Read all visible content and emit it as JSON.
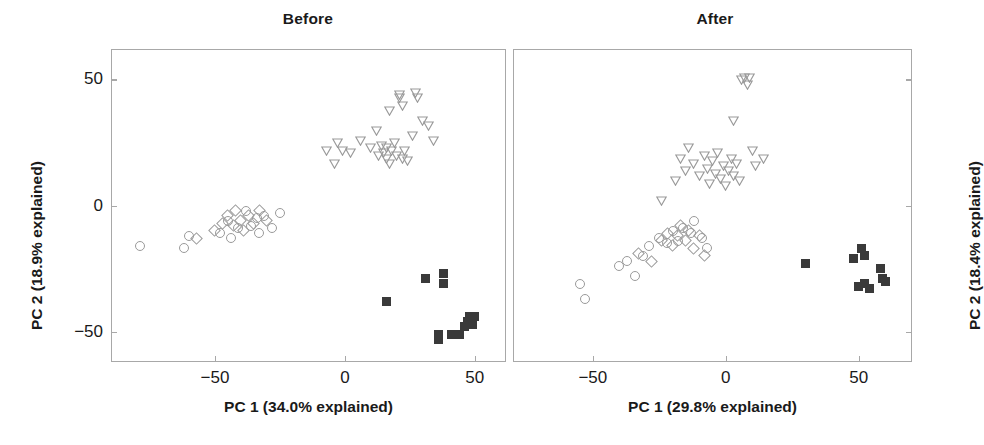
{
  "figure": {
    "width": 983,
    "height": 445,
    "background": "#ffffff",
    "marker_outline_color": "#9a9a9a",
    "filled_marker_color": "#3a3a3a",
    "axis_color": "#a8a8a8"
  },
  "chart_data": [
    {
      "type": "scatter",
      "title": "Before",
      "xlabel": "PC 1 (34.0% explained)",
      "ylabel": "PC 2 (18.9% explained)",
      "xlim": [
        -90,
        62
      ],
      "ylim": [
        -62,
        62
      ],
      "xticks": [
        -50,
        0,
        50
      ],
      "xticklabels": [
        "−50",
        "0",
        "50"
      ],
      "yticks": [
        50,
        0,
        -50
      ],
      "yticklabels": [
        "50",
        "0",
        "−50"
      ],
      "ylabel_side": "left",
      "grid": false,
      "legend": "none",
      "series": [
        {
          "name": "group-circle",
          "marker": "circle",
          "fill": "open",
          "color": "#9a9a9a",
          "points": [
            [
              -79,
              -16
            ],
            [
              -62,
              -17
            ],
            [
              -60,
              -12
            ],
            [
              -48,
              -11
            ],
            [
              -45,
              -6
            ],
            [
              -44,
              -13
            ],
            [
              -41,
              -9
            ],
            [
              -38,
              -2
            ],
            [
              -36,
              -8
            ],
            [
              -34,
              -5
            ],
            [
              -33,
              -11
            ],
            [
              -31,
              -4
            ],
            [
              -28,
              -9
            ],
            [
              -25,
              -3
            ]
          ]
        },
        {
          "name": "group-diamond",
          "marker": "diamond",
          "fill": "open",
          "color": "#9a9a9a",
          "points": [
            [
              -57,
              -13
            ],
            [
              -50,
              -10
            ],
            [
              -47,
              -7
            ],
            [
              -45,
              -4
            ],
            [
              -43,
              -8
            ],
            [
              -42,
              -2
            ],
            [
              -40,
              -6
            ],
            [
              -39,
              -10
            ],
            [
              -37,
              -4
            ],
            [
              -35,
              -7
            ],
            [
              -33,
              -2
            ],
            [
              -30,
              -6
            ]
          ]
        },
        {
          "name": "group-triangle",
          "marker": "triangle-down",
          "fill": "open",
          "color": "#9a9a9a",
          "points": [
            [
              -7,
              22
            ],
            [
              -4,
              17
            ],
            [
              -3,
              25
            ],
            [
              -1,
              22
            ],
            [
              2,
              21
            ],
            [
              6,
              26
            ],
            [
              10,
              23
            ],
            [
              12,
              30
            ],
            [
              13,
              20
            ],
            [
              14,
              24
            ],
            [
              15,
              21
            ],
            [
              16,
              19
            ],
            [
              16,
              23
            ],
            [
              17,
              17
            ],
            [
              18,
              22
            ],
            [
              19,
              25
            ],
            [
              20,
              20
            ],
            [
              21,
              43
            ],
            [
              21,
              44
            ],
            [
              22,
              40
            ],
            [
              22,
              19
            ],
            [
              23,
              22
            ],
            [
              24,
              18
            ],
            [
              26,
              28
            ],
            [
              27,
              45
            ],
            [
              28,
              43
            ],
            [
              30,
              34
            ],
            [
              32,
              32
            ],
            [
              34,
              26
            ],
            [
              17,
              38
            ]
          ]
        },
        {
          "name": "group-square",
          "marker": "square",
          "fill": "filled",
          "color": "#3a3a3a",
          "points": [
            [
              16,
              -38
            ],
            [
              31,
              -29
            ],
            [
              36,
              -53
            ],
            [
              36,
              -51
            ],
            [
              38,
              -27
            ],
            [
              38,
              -31
            ],
            [
              41,
              -51
            ],
            [
              44,
              -51
            ],
            [
              46,
              -48
            ],
            [
              47,
              -46
            ],
            [
              48,
              -44
            ],
            [
              49,
              -47
            ],
            [
              50,
              -44
            ]
          ]
        }
      ]
    },
    {
      "type": "scatter",
      "title": "After",
      "xlabel": "PC 1 (29.8% explained)",
      "ylabel": "PC 2 (18.4% explained)",
      "xlim": [
        -80,
        70
      ],
      "ylim": [
        -62,
        62
      ],
      "xticks": [
        -50,
        0,
        50
      ],
      "xticklabels": [
        "−50",
        "0",
        "50"
      ],
      "yticks": [
        50,
        0,
        -50
      ],
      "yticklabels": [
        "",
        "",
        ""
      ],
      "ylabel_side": "right",
      "grid": false,
      "legend": "none",
      "series": [
        {
          "name": "group-circle",
          "marker": "circle",
          "fill": "open",
          "color": "#9a9a9a",
          "points": [
            [
              -55,
              -31
            ],
            [
              -53,
              -37
            ],
            [
              -40,
              -24
            ],
            [
              -37,
              -22
            ],
            [
              -34,
              -28
            ],
            [
              -31,
              -20
            ],
            [
              -29,
              -16
            ],
            [
              -25,
              -13
            ],
            [
              -22,
              -15
            ],
            [
              -20,
              -10
            ],
            [
              -18,
              -14
            ],
            [
              -16,
              -9
            ],
            [
              -13,
              -11
            ],
            [
              -12,
              -6
            ],
            [
              -9,
              -13
            ],
            [
              -7,
              -17
            ]
          ]
        },
        {
          "name": "group-diamond",
          "marker": "diamond",
          "fill": "open",
          "color": "#9a9a9a",
          "points": [
            [
              -33,
              -19
            ],
            [
              -28,
              -22
            ],
            [
              -24,
              -14
            ],
            [
              -22,
              -11
            ],
            [
              -20,
              -16
            ],
            [
              -18,
              -12
            ],
            [
              -17,
              -8
            ],
            [
              -15,
              -14
            ],
            [
              -14,
              -10
            ],
            [
              -12,
              -17
            ],
            [
              -10,
              -12
            ],
            [
              -8,
              -20
            ]
          ]
        },
        {
          "name": "group-triangle",
          "marker": "triangle-down",
          "fill": "open",
          "color": "#9a9a9a",
          "points": [
            [
              -19,
              10
            ],
            [
              -17,
              19
            ],
            [
              -15,
              14
            ],
            [
              -14,
              23
            ],
            [
              -12,
              17
            ],
            [
              -10,
              12
            ],
            [
              -8,
              20
            ],
            [
              -7,
              15
            ],
            [
              -6,
              9
            ],
            [
              -5,
              18
            ],
            [
              -4,
              13
            ],
            [
              -3,
              21
            ],
            [
              -2,
              11
            ],
            [
              -1,
              16
            ],
            [
              0,
              8
            ],
            [
              1,
              14
            ],
            [
              2,
              19
            ],
            [
              3,
              12
            ],
            [
              3,
              34
            ],
            [
              4,
              17
            ],
            [
              5,
              10
            ],
            [
              6,
              50
            ],
            [
              7,
              51
            ],
            [
              8,
              48
            ],
            [
              9,
              51
            ],
            [
              10,
              22
            ],
            [
              11,
              16
            ],
            [
              14,
              19
            ],
            [
              -24,
              2
            ]
          ]
        },
        {
          "name": "group-square",
          "marker": "square",
          "fill": "filled",
          "color": "#3a3a3a",
          "points": [
            [
              30,
              -23
            ],
            [
              48,
              -21
            ],
            [
              51,
              -17
            ],
            [
              52,
              -20
            ],
            [
              50,
              -32
            ],
            [
              52,
              -31
            ],
            [
              54,
              -33
            ],
            [
              58,
              -25
            ],
            [
              59,
              -29
            ],
            [
              60,
              -30
            ]
          ]
        }
      ]
    }
  ]
}
